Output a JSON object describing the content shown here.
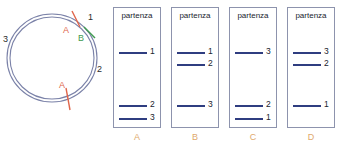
{
  "figure": {
    "background_color": "#ffffff"
  },
  "circle_diagram": {
    "name": "circular-dna-map",
    "outline_color": "#7b82a8",
    "segment_labels": [
      {
        "id": "seg-1",
        "text": "1",
        "x": 88,
        "y": 17
      },
      {
        "id": "seg-2",
        "text": "2",
        "x": 97,
        "y": 69
      },
      {
        "id": "seg-3",
        "text": "3",
        "x": 4,
        "y": 38
      }
    ],
    "cut_sites": [
      {
        "id": "cut-a-top",
        "text": "A",
        "color": "#e0654a",
        "x": 64,
        "y": 29
      },
      {
        "id": "cut-b-top",
        "text": "B",
        "color": "#3f9a4f",
        "x": 79,
        "y": 36
      },
      {
        "id": "cut-a-bottom",
        "text": "A",
        "color": "#e0654a",
        "x": 60,
        "y": 84
      }
    ]
  },
  "panels": {
    "header_label": "partenza",
    "band_color": "#2f3d80",
    "letter_color": "#e0a96d",
    "items": [
      {
        "letter": "A",
        "left": 0,
        "bands": [
          {
            "label": "1",
            "top": 44
          },
          {
            "label": "2",
            "top": 97
          },
          {
            "label": "3",
            "top": 110
          }
        ]
      },
      {
        "letter": "B",
        "left": 58,
        "bands": [
          {
            "label": "1",
            "top": 44
          },
          {
            "label": "2",
            "top": 56
          },
          {
            "label": "3",
            "top": 97
          }
        ]
      },
      {
        "letter": "C",
        "left": 116,
        "bands": [
          {
            "label": "3",
            "top": 44
          },
          {
            "label": "2",
            "top": 97
          },
          {
            "label": "1",
            "top": 110
          }
        ]
      },
      {
        "letter": "D",
        "left": 174,
        "bands": [
          {
            "label": "3",
            "top": 44
          },
          {
            "label": "2",
            "top": 56
          },
          {
            "label": "1",
            "top": 97
          }
        ]
      }
    ]
  }
}
